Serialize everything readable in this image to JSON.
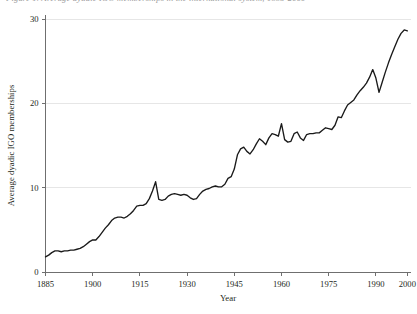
{
  "figure": {
    "caption_sliver": "Figure 1.  Average dyadic IGO memberships in the international system, 1885-2000",
    "background_color": "#ffffff",
    "line_color": "#1a1a1a",
    "grid_color": "#e6e6e6",
    "axis_color": "#6f6f6f"
  },
  "chart_data": {
    "type": "line",
    "title": "",
    "subtitle": "",
    "xlabel": "Year",
    "ylabel": "Average dyadic IGO memberships",
    "xlim": [
      1885,
      2001
    ],
    "ylim": [
      0,
      30
    ],
    "xticks": [
      1885,
      1900,
      1915,
      1930,
      1945,
      1960,
      1975,
      1990,
      2000
    ],
    "xtick_labels": [
      "1885",
      "1900",
      "1915",
      "1930",
      "1945",
      "1960",
      "1975",
      "1990",
      "2000"
    ],
    "yticks": [
      0,
      10,
      20,
      30
    ],
    "ytick_labels": [
      "0",
      "10",
      "20",
      "30"
    ],
    "grid": "horizontal",
    "legend": "none",
    "annotations": [],
    "series": [
      {
        "name": "Average dyadic IGO memberships",
        "color": "#1a1a1a",
        "x": [
          1885,
          1886,
          1887,
          1888,
          1889,
          1890,
          1891,
          1892,
          1893,
          1894,
          1895,
          1896,
          1897,
          1898,
          1899,
          1900,
          1901,
          1902,
          1903,
          1904,
          1905,
          1906,
          1907,
          1908,
          1909,
          1910,
          1911,
          1912,
          1913,
          1914,
          1915,
          1916,
          1917,
          1918,
          1919,
          1920,
          1921,
          1922,
          1923,
          1924,
          1925,
          1926,
          1927,
          1928,
          1929,
          1930,
          1931,
          1932,
          1933,
          1934,
          1935,
          1936,
          1937,
          1938,
          1939,
          1940,
          1941,
          1942,
          1943,
          1944,
          1945,
          1946,
          1947,
          1948,
          1949,
          1950,
          1951,
          1952,
          1953,
          1954,
          1955,
          1956,
          1957,
          1958,
          1959,
          1960,
          1961,
          1962,
          1963,
          1964,
          1965,
          1966,
          1967,
          1968,
          1969,
          1970,
          1971,
          1972,
          1973,
          1974,
          1975,
          1976,
          1977,
          1978,
          1979,
          1980,
          1981,
          1982,
          1983,
          1984,
          1985,
          1986,
          1987,
          1988,
          1989,
          1990,
          1991,
          1992,
          1993,
          1994,
          1995,
          1996,
          1997,
          1998,
          1999,
          2000
        ],
        "values": [
          1.8,
          2.0,
          2.3,
          2.5,
          2.5,
          2.4,
          2.5,
          2.5,
          2.6,
          2.6,
          2.7,
          2.8,
          3.0,
          3.3,
          3.6,
          3.8,
          3.8,
          4.2,
          4.7,
          5.2,
          5.6,
          6.1,
          6.4,
          6.5,
          6.5,
          6.4,
          6.6,
          6.9,
          7.3,
          7.8,
          7.9,
          7.9,
          8.1,
          8.7,
          9.6,
          10.7,
          8.6,
          8.5,
          8.6,
          9.0,
          9.2,
          9.3,
          9.2,
          9.1,
          9.2,
          9.1,
          8.8,
          8.6,
          8.7,
          9.2,
          9.6,
          9.8,
          9.9,
          10.1,
          10.2,
          10.1,
          10.1,
          10.4,
          11.1,
          11.3,
          12.2,
          13.9,
          14.6,
          14.8,
          14.3,
          14.0,
          14.5,
          15.2,
          15.8,
          15.5,
          15.1,
          15.9,
          16.4,
          16.3,
          16.1,
          17.6,
          15.7,
          15.4,
          15.5,
          16.4,
          16.6,
          15.9,
          15.6,
          16.3,
          16.4,
          16.4,
          16.5,
          16.5,
          16.8,
          17.1,
          17.0,
          16.9,
          17.4,
          18.4,
          18.3,
          19.1,
          19.8,
          20.1,
          20.4,
          21.0,
          21.5,
          21.9,
          22.4,
          23.1,
          24.0,
          23.0,
          21.3,
          22.5,
          23.7,
          24.8,
          25.8,
          26.7,
          27.6,
          28.3,
          28.7,
          28.6
        ]
      }
    ]
  }
}
